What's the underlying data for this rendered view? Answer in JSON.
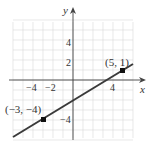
{
  "chart_data": {
    "type": "line",
    "title": "",
    "xlabel": "x",
    "ylabel": "y",
    "xlim": [
      -6,
      6
    ],
    "ylim": [
      -6,
      6
    ],
    "grid": true,
    "x_ticks": [
      {
        "value": -4,
        "label": "−4"
      },
      {
        "value": -2,
        "label": "−2"
      },
      {
        "value": 4,
        "label": "4"
      }
    ],
    "y_ticks": [
      {
        "value": 4,
        "label": "4"
      },
      {
        "value": 2,
        "label": "2"
      },
      {
        "value": -4,
        "label": "−4"
      }
    ],
    "series": [
      {
        "name": "line through (-3,-4) and (5,1)",
        "x": [
          -6,
          6
        ],
        "y": [
          -5.875,
          1.625
        ],
        "color": "#3a3a3a"
      }
    ],
    "points": [
      {
        "x": 5,
        "y": 1,
        "label": "(5, 1)"
      },
      {
        "x": -3,
        "y": -4,
        "label": "(−3, −4)"
      }
    ]
  },
  "style": {
    "grid_color": "#d9d9d9",
    "axis_color": "#444444",
    "line_color": "#3a3a3a"
  }
}
